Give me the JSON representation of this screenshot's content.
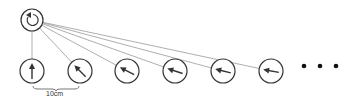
{
  "diagram": {
    "source": {
      "cx": 32,
      "cy": 20,
      "r": 11,
      "icon": "rotate-ccw-icon"
    },
    "nodes": [
      {
        "cx": 32,
        "cy": 71,
        "angle": 0
      },
      {
        "cx": 80,
        "cy": 71,
        "angle": -45
      },
      {
        "cx": 127,
        "cy": 71,
        "angle": -63
      },
      {
        "cx": 175,
        "cy": 71,
        "angle": -72
      },
      {
        "cx": 223,
        "cy": 71,
        "angle": -76
      },
      {
        "cx": 271,
        "cy": 71,
        "angle": -80
      }
    ],
    "node_radius": 12,
    "ellipsis_dots": [
      304,
      320,
      336
    ],
    "ellipsis_y": 66,
    "scale_label": "10cm",
    "colors": {
      "stroke": "#333333",
      "line": "#999999"
    }
  }
}
